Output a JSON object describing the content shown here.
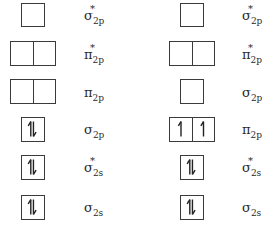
{
  "diagram": {
    "type": "molecular-orbital-filling",
    "columns": [
      {
        "id": "left",
        "orbitals": [
          {
            "label": "σ",
            "sup": "*",
            "sub": "2p",
            "boxes": 1,
            "electrons": [
              0
            ]
          },
          {
            "label": "π",
            "sup": "*",
            "sub": "2p",
            "boxes": 2,
            "electrons": [
              0,
              0
            ]
          },
          {
            "label": "π",
            "sup": "",
            "sub": "2p",
            "boxes": 2,
            "electrons": [
              0,
              0
            ]
          },
          {
            "label": "σ",
            "sup": "",
            "sub": "2p",
            "boxes": 1,
            "electrons": [
              2
            ]
          },
          {
            "label": "σ",
            "sup": "*",
            "sub": "2s",
            "boxes": 1,
            "electrons": [
              2
            ]
          },
          {
            "label": "σ",
            "sup": "",
            "sub": "2s",
            "boxes": 1,
            "electrons": [
              2
            ]
          }
        ]
      },
      {
        "id": "right",
        "orbitals": [
          {
            "label": "σ",
            "sup": "*",
            "sub": "2p",
            "boxes": 1,
            "electrons": [
              0
            ]
          },
          {
            "label": "π",
            "sup": "*",
            "sub": "2p",
            "boxes": 2,
            "electrons": [
              0,
              0
            ]
          },
          {
            "label": "σ",
            "sup": "",
            "sub": "2p",
            "boxes": 1,
            "electrons": [
              0
            ]
          },
          {
            "label": "π",
            "sup": "",
            "sub": "2p",
            "boxes": 2,
            "electrons": [
              1,
              1
            ]
          },
          {
            "label": "σ",
            "sup": "*",
            "sub": "2s",
            "boxes": 1,
            "electrons": [
              2
            ]
          },
          {
            "label": "σ",
            "sup": "",
            "sub": "2s",
            "boxes": 1,
            "electrons": [
              2
            ]
          }
        ]
      }
    ]
  },
  "labels": {
    "l0": {
      "sym": "σ",
      "sup": "*",
      "sub": "2p"
    },
    "l1": {
      "sym": "π",
      "sup": "*",
      "sub": "2p"
    },
    "l2": {
      "sym": "π",
      "sup": "",
      "sub": "2p"
    },
    "l3": {
      "sym": "σ",
      "sup": "",
      "sub": "2p"
    },
    "l4": {
      "sym": "σ",
      "sup": "*",
      "sub": "2s"
    },
    "l5": {
      "sym": "σ",
      "sup": "",
      "sub": "2s"
    },
    "r0": {
      "sym": "σ",
      "sup": "*",
      "sub": "2p"
    },
    "r1": {
      "sym": "π",
      "sup": "*",
      "sub": "2p"
    },
    "r2": {
      "sym": "σ",
      "sup": "",
      "sub": "2p"
    },
    "r3": {
      "sym": "π",
      "sup": "",
      "sub": "2p"
    },
    "r4": {
      "sym": "σ",
      "sup": "*",
      "sub": "2s"
    },
    "r5": {
      "sym": "σ",
      "sup": "",
      "sub": "2s"
    }
  }
}
